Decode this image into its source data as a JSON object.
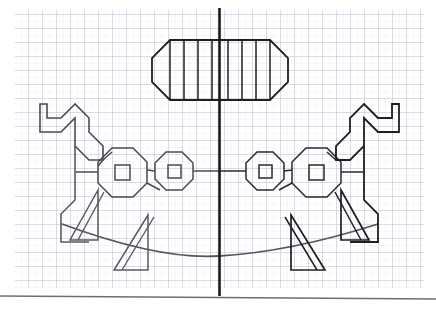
{
  "figure": {
    "medium": "pencil on quadrille graph paper",
    "symmetry": "bilateral mirror about vertical axis",
    "background_color": "#ffffff",
    "paper_color": "#fefefe"
  },
  "grid": {
    "label": "quadrille graph paper",
    "minor_cell_px": 7,
    "major_cell_px": 14,
    "minor_color": "#d9dce6",
    "major_color": "#aeb4c6",
    "region": {
      "x": 15,
      "y": 10,
      "width": 409,
      "height": 278
    }
  },
  "axis": {
    "name": "vertical symmetry axis",
    "color": "#1a1a1a",
    "stroke": 2.6,
    "x": 219.5,
    "y1": 8,
    "y2": 296
  },
  "baseline": {
    "name": "page edge rule",
    "color": "#6f6f6f",
    "stroke": 1.6,
    "x1": 0,
    "y1": 296,
    "x2": 436,
    "y2": 299
  },
  "palette": {
    "ink_dark": "#1f1f1f",
    "ink_mid": "#5a5a60",
    "ink_light": "#7b7b84"
  },
  "shapes": {
    "barrel": {
      "name": "barrel-body",
      "outline": "170,40 270,40 288,58 288,82 270,100 170,100 152,82 152,58",
      "slat_xs": [
        170,
        184,
        198,
        212,
        228,
        242,
        256,
        270
      ],
      "slat_top": 40,
      "slat_bottom": 100,
      "stroke": 1.8,
      "color": "#1f1f1f",
      "slat_count": 8
    },
    "octagon_left_outer": {
      "name": "wheel-left-outer",
      "points": "112,148 133,148 147,162 147,183 133,197 112,197 98,183 98,162",
      "stroke": 1.5,
      "color": "#4a4a52"
    },
    "octagon_left_inner": {
      "name": "wheel-left-hub",
      "points": "115,165 130,165 130,180 115,180",
      "stroke": 1.5,
      "color": "#4a4a52"
    },
    "octagon_mid_left_outer": {
      "name": "wheel-mid-left-outer",
      "points": "166,152 182,152 193,163 193,179 182,190 166,190 155,179 155,163",
      "stroke": 1.5,
      "color": "#4a4a52"
    },
    "octagon_mid_left_inner": {
      "name": "wheel-mid-left-hub",
      "points": "168,165 181,165 181,178 168,178",
      "stroke": 1.5,
      "color": "#4a4a52"
    },
    "octagon_mid_right_outer": {
      "name": "wheel-mid-right-outer",
      "points": "257,152 273,152 284,163 284,179 273,190 257,190 246,179 246,163",
      "stroke": 1.5,
      "color": "#2a2a2e"
    },
    "octagon_mid_right_inner": {
      "name": "wheel-mid-right-hub",
      "points": "259,165 272,165 272,178 259,178",
      "stroke": 1.5,
      "color": "#2a2a2e"
    },
    "octagon_right_outer": {
      "name": "wheel-right-outer",
      "points": "306,148 327,148 341,162 341,183 327,197 306,197 292,183 292,162",
      "stroke": 1.5,
      "color": "#2a2a2e"
    },
    "octagon_right_inner": {
      "name": "wheel-right-hub",
      "points": "309,165 324,165 324,180 309,180",
      "stroke": 1.5,
      "color": "#2a2a2e"
    },
    "horse_left_head": {
      "name": "horse-left-head-and-neck",
      "path": "M 75,104 L 61,118 L 47,118 L 47,104 L 40,104 L 40,132 L 61,132 L 75,118 L 75,146 L 89,160 L 103,160 L 103,146 L 89,132 L 89,118 L 75,104 Z",
      "stroke": 1.6,
      "color": "#4a4a52"
    },
    "horse_left_body": {
      "name": "horse-left-body-outline",
      "path": "M 103,160 L 98,166",
      "stroke": 1.6,
      "color": "#4a4a52"
    },
    "horse_left_chest": {
      "name": "horse-left-chest-line",
      "path": "M 75,146 L 75,200 L 61,214 L 61,242 L 89,242",
      "stroke": 1.6,
      "color": "#5a5a60"
    },
    "horse_right_head": {
      "name": "horse-right-head-and-neck",
      "path": "M 364,104 L 378,118 L 392,118 L 392,104 L 399,104 L 399,132 L 378,132 L 364,118 L 364,146 L 350,160 L 336,160 L 336,146 L 350,132 L 350,118 L 364,104 Z",
      "stroke": 1.8,
      "color": "#1f1f1f"
    },
    "horse_right_chest": {
      "name": "horse-right-chest-line",
      "path": "M 364,146 L 364,200 L 378,214 L 378,242 L 350,242",
      "stroke": 1.8,
      "color": "#1f1f1f"
    },
    "rocker": {
      "name": "rocker-base-curve",
      "path": "M 62,224 Q 160,260 219,256 Q 290,252 378,224",
      "stroke": 1.8,
      "color": "#55555c"
    },
    "legs": [
      {
        "name": "leg-left-front",
        "path": "M 98,190 L 70,240 L 98,240 Z",
        "stroke": 1.5,
        "color": "#5a5a60"
      },
      {
        "name": "leg-left-front-inner",
        "path": "M 104,192 L 78,240",
        "stroke": 1.4,
        "color": "#5a5a60"
      },
      {
        "name": "leg-left-rear",
        "path": "M 148,215 L 114,270 L 148,270 Z",
        "stroke": 1.5,
        "color": "#5a5a60"
      },
      {
        "name": "leg-left-rear-inner",
        "path": "M 154,217 L 122,270",
        "stroke": 1.4,
        "color": "#5a5a60"
      },
      {
        "name": "leg-right-front",
        "path": "M 341,190 L 369,240 L 341,240 Z",
        "stroke": 1.7,
        "color": "#1f1f1f"
      },
      {
        "name": "leg-right-front-inner",
        "path": "M 335,192 L 361,240",
        "stroke": 1.5,
        "color": "#1f1f1f"
      },
      {
        "name": "leg-right-rear",
        "path": "M 291,215 L 325,270 L 291,270 Z",
        "stroke": 1.7,
        "color": "#1f1f1f"
      },
      {
        "name": "leg-right-rear-inner",
        "path": "M 285,217 L 317,270",
        "stroke": 1.5,
        "color": "#1f1f1f"
      }
    ],
    "connectors": [
      {
        "name": "connector-left-outer",
        "path": "M 98,172 L 76,172",
        "stroke": 1.5,
        "color": "#4a4a52"
      },
      {
        "name": "connector-left-inner",
        "path": "M 147,170 L 155,171",
        "stroke": 1.5,
        "color": "#4a4a52"
      },
      {
        "name": "connector-center-left",
        "path": "M 193,171 L 219,171",
        "stroke": 1.5,
        "color": "#4a4a52"
      },
      {
        "name": "connector-center-right",
        "path": "M 219,171 L 246,171",
        "stroke": 1.5,
        "color": "#2a2a2e"
      },
      {
        "name": "connector-right-inner",
        "path": "M 284,171 L 292,170",
        "stroke": 1.5,
        "color": "#2a2a2e"
      },
      {
        "name": "connector-right-outer",
        "path": "M 341,172 L 363,172",
        "stroke": 1.5,
        "color": "#2a2a2e"
      },
      {
        "name": "connector-left-neck",
        "path": "M 103,160 L 112,152",
        "stroke": 1.5,
        "color": "#4a4a52"
      },
      {
        "name": "connector-right-neck",
        "path": "M 336,160 L 327,152",
        "stroke": 1.5,
        "color": "#2a2a2e"
      },
      {
        "name": "connector-left-low",
        "path": "M 147,183 L 160,190",
        "stroke": 1.5,
        "color": "#4a4a52"
      },
      {
        "name": "connector-right-low",
        "path": "M 292,183 L 279,190",
        "stroke": 1.5,
        "color": "#2a2a2e"
      }
    ]
  }
}
